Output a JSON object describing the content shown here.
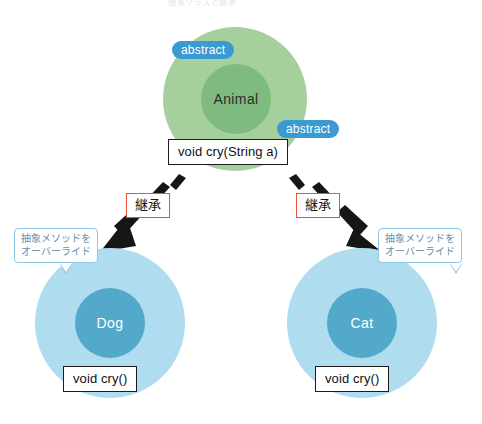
{
  "diagram": {
    "title_caption": "抽象クラスと継承",
    "type": "uml-inheritance-diagram"
  },
  "parent": {
    "class_name": "Animal",
    "badge_top": "abstract",
    "badge_method": "abstract",
    "method_signature": "void cry(String a)",
    "outer_color": "#9ecb96",
    "inner_color": "#7fbb80",
    "badge_color": "#3a9ad1"
  },
  "relations": [
    {
      "label": "継承",
      "border_color": "#e8533a",
      "direction": "down-left"
    },
    {
      "label": "継承",
      "border_color": "#e8533a",
      "direction": "down-right"
    }
  ],
  "children": [
    {
      "class_name": "Dog",
      "method_signature": "void cry()",
      "note_line1": "抽象メソッドを",
      "note_line2": "オーバーライド",
      "outer_color": "#b0dcef",
      "inner_color": "#53a9ca"
    },
    {
      "class_name": "Cat",
      "method_signature": "void cry()",
      "note_line1": "抽象メソッドを",
      "note_line2": "オーバーライド",
      "outer_color": "#b0dcef",
      "inner_color": "#53a9ca"
    }
  ]
}
